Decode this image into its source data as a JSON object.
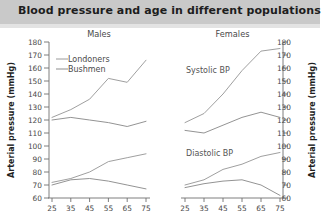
{
  "header": {
    "title": "Blood pressure and age in different populations",
    "bg_color": "#c9c9c9"
  },
  "axis": {
    "y_label_left": "Arterial pressure (mmHg)",
    "y_label_right": "Arterial pressure (mmHg)",
    "y_ticks": [
      180,
      170,
      160,
      150,
      140,
      130,
      120,
      110,
      100,
      90,
      80,
      70,
      60
    ],
    "x_ticks": [
      25,
      35,
      45,
      55,
      65,
      75
    ]
  },
  "panels": {
    "left_header": "Males",
    "right_header": "Females"
  },
  "annotations": {
    "systolic": "Systolic BP",
    "diastolic": "Diastolic BP"
  },
  "legend": {
    "items": [
      {
        "label": "Londoners",
        "color": "#9a9a9a"
      },
      {
        "label": "Bushmen",
        "color": "#8d8d8d"
      }
    ]
  },
  "chart_data": {
    "type": "line",
    "title": "Blood pressure and age in different populations",
    "xlabel": "",
    "ylabel": "Arterial pressure (mmHg)",
    "ylim": [
      60,
      180
    ],
    "grid": false,
    "legend_position": "top-left",
    "panels": [
      {
        "name": "Males",
        "x": [
          25,
          35,
          45,
          55,
          65,
          75
        ],
        "series": [
          {
            "name": "Londoners systolic",
            "population": "Londoners",
            "measure": "Systolic BP",
            "values": [
              122,
              128,
              136,
              152,
              149,
              166
            ]
          },
          {
            "name": "Bushmen systolic",
            "population": "Bushmen",
            "measure": "Systolic BP",
            "values": [
              120,
              122,
              120,
              118,
              115,
              119
            ]
          },
          {
            "name": "Londoners diastolic",
            "population": "Londoners",
            "measure": "Diastolic BP",
            "values": [
              72,
              75,
              80,
              88,
              91,
              94
            ]
          },
          {
            "name": "Bushmen diastolic",
            "population": "Bushmen",
            "measure": "Diastolic BP",
            "values": [
              70,
              74,
              75,
              73,
              70,
              67
            ]
          }
        ]
      },
      {
        "name": "Females",
        "x": [
          25,
          35,
          45,
          55,
          65,
          75
        ],
        "series": [
          {
            "name": "Londoners systolic",
            "population": "Londoners",
            "measure": "Systolic BP",
            "values": [
              118,
              125,
              140,
              158,
              173,
              175
            ]
          },
          {
            "name": "Bushmen systolic",
            "population": "Bushmen",
            "measure": "Systolic BP",
            "values": [
              112,
              110,
              116,
              122,
              126,
              122
            ]
          },
          {
            "name": "Londoners diastolic",
            "population": "Londoners",
            "measure": "Diastolic BP",
            "values": [
              70,
              74,
              82,
              86,
              92,
              95
            ]
          },
          {
            "name": "Bushmen diastolic",
            "population": "Bushmen",
            "measure": "Diastolic BP",
            "values": [
              68,
              71,
              73,
              74,
              70,
              62
            ]
          }
        ]
      }
    ]
  }
}
